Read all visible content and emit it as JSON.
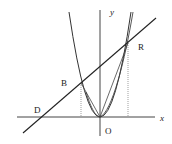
{
  "diagram": {
    "type": "geometry-figure",
    "labels": {
      "x_axis": "x",
      "y_axis": "y",
      "origin": "O",
      "point_d": "D",
      "point_b": "B",
      "point_r": "R"
    },
    "elements": [
      "x-axis",
      "y-axis",
      "wide parabola through O and B",
      "narrow parabola through O and R",
      "line through D, B, R",
      "chord O-B",
      "chord O-R",
      "dotted projection from B to x-axis",
      "dotted projection from R to x-axis"
    ],
    "colors": {
      "stroke": "#333333",
      "background": "#ffffff"
    }
  }
}
